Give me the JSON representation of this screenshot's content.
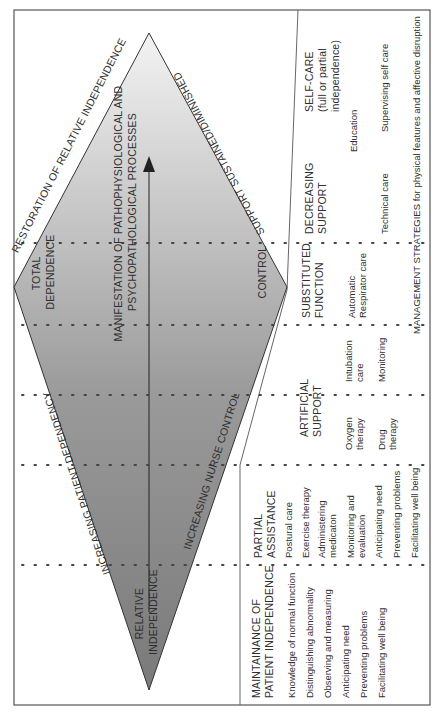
{
  "diagram": {
    "diamond": {
      "left_vertex_label": [
        "TOTAL",
        "DEPENDENCE"
      ],
      "right_vertex_label": [
        "RELATIVE",
        "INDEPENDENCE"
      ],
      "upper_left_edge_label": "RESTORATION OF RELATIVE INDEPENDENCE",
      "upper_right_edge_label": "INCREASING PATIENT DEPENDENCY",
      "lower_left_edge_label": "SUPPORT SUSTAINED/DIMINISHED",
      "lower_right_edge_label": "INCREASING NURSE CONTROL",
      "center_label": [
        "MANIFESTATION OF PATHOPHYSIOLOGICAL AND",
        "PSYCHOPATHOLOGICAL PROCESSES"
      ],
      "control_label": "CONTROL",
      "arrow_direction": "toward total dependence side"
    },
    "columns": [
      {
        "heading": [
          "MAINTAINANCE OF",
          "PATIENT INDEPENDENCE"
        ],
        "items": [
          "Knowledge of normal function",
          "Distinguishing  abnormality",
          "Observing and measuring",
          "Anticipating need",
          "Preventing problems",
          "Facilitating  well being"
        ]
      },
      {
        "heading": [
          "PARTIAL",
          "ASSISTANCE"
        ],
        "items": [
          "Postural care",
          "Exercise therapy",
          "Administering",
          "medicaton",
          "Monitoring and",
          "evaluation",
          "Anticipating need",
          "Preventing problems",
          "Facilitating well being"
        ]
      },
      {
        "heading": [
          "ARTIFICIAL",
          "SUPPORT"
        ],
        "items": [
          "Oxygen",
          "therapy",
          "Drug",
          "therapy",
          "Intubation",
          "care",
          "Monitoring"
        ]
      },
      {
        "heading": [
          "SUBSTITUTED",
          "FUNCTION"
        ],
        "items": [
          "Automatic",
          "Respirator care"
        ]
      },
      {
        "heading": [
          "DECREASING",
          "SUPPORT"
        ],
        "items": [
          "Education",
          "Technical care"
        ]
      },
      {
        "heading": [
          "SELF-CARE",
          "(full or partial",
          "independence)"
        ],
        "items": [
          "Supervising self care"
        ]
      }
    ],
    "footer_label": "MANAGEMENT STRATEGIES for physical features and affective disruption",
    "colors": {
      "border": "#555555",
      "diamond_dark": "#7d7d7d",
      "diamond_light": "#f2f2f2",
      "dots": "#444444"
    }
  }
}
